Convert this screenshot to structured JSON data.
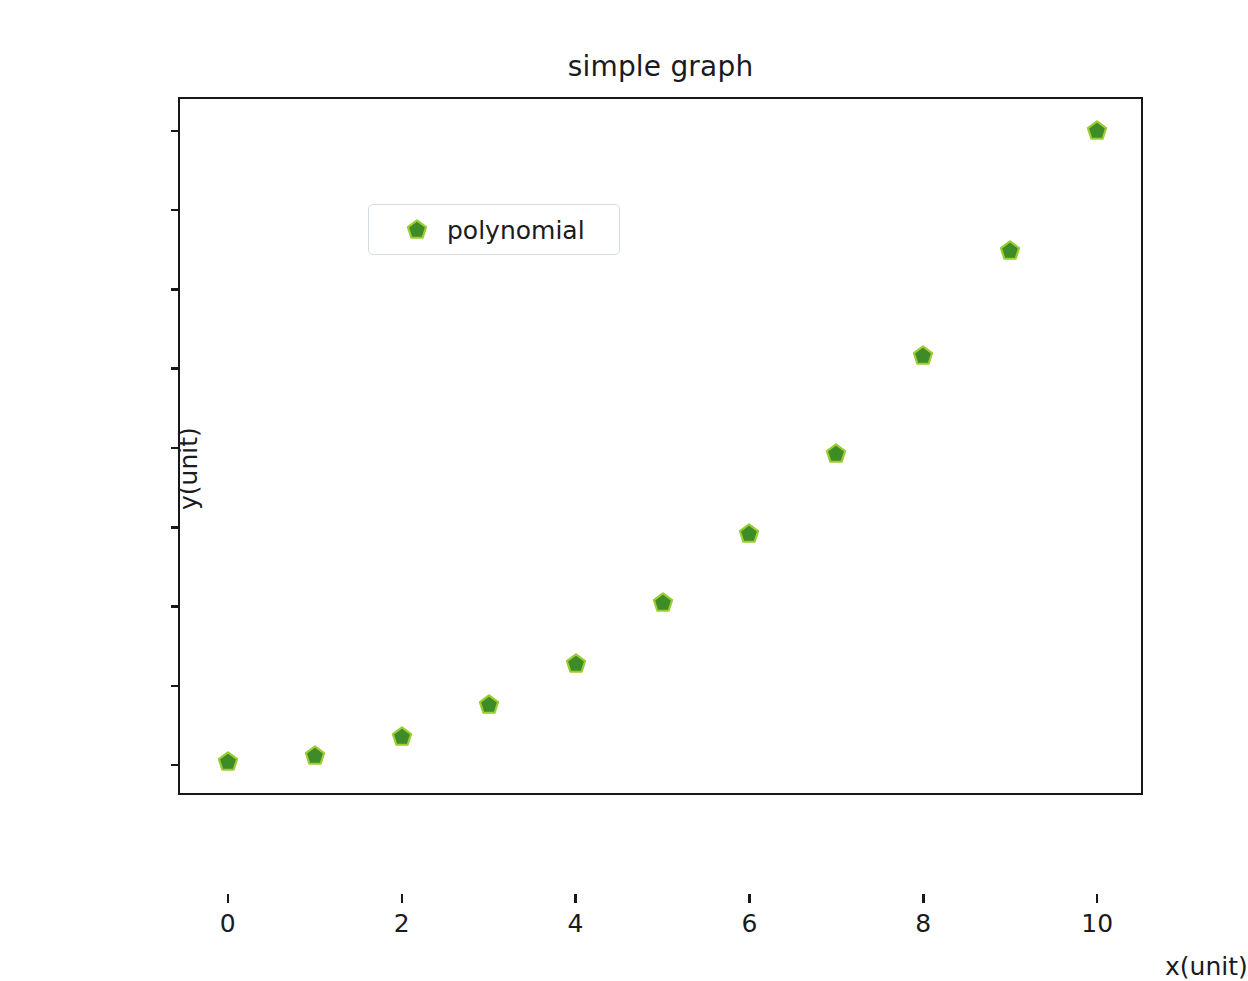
{
  "chart_data": {
    "type": "scatter",
    "title": "simple graph",
    "xlabel": "x(unit)",
    "ylabel": "y(unit)",
    "xlim": [
      -0.55,
      10.55
    ],
    "ylim": [
      -10,
      210
    ],
    "grid": false,
    "legend_position": "upper left",
    "marker": "pentagon",
    "marker_face_color": "#3d8c28",
    "marker_edge_color": "#9acd32",
    "axes_color": "#17171f",
    "background_color": "#ffffff",
    "xticks": [
      0,
      2,
      4,
      6,
      8,
      10
    ],
    "xtick_labels": [
      "0",
      "2",
      "4",
      "6",
      "8",
      "10"
    ],
    "yticks": [
      0,
      25,
      50,
      75,
      100,
      125,
      150,
      175,
      200
    ],
    "ytick_labels": [
      "0",
      "25",
      "50",
      "75",
      "100",
      "125",
      "150",
      "175",
      "200"
    ],
    "series": [
      {
        "name": "polynomial",
        "x": [
          0,
          1,
          2,
          3,
          4,
          5,
          6,
          7,
          8,
          9,
          10
        ],
        "values": [
          1,
          3,
          9,
          19,
          32,
          51,
          73,
          98,
          129,
          162,
          200
        ]
      }
    ]
  },
  "legend": {
    "entries": [
      {
        "label": "polynomial",
        "color": "#3d8c28"
      }
    ]
  }
}
